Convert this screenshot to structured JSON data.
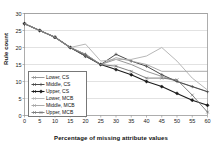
{
  "chart_data": {
    "type": "line",
    "title": "",
    "xlabel": "Percentage of missing attribute values",
    "ylabel": "Rule count",
    "xlim": [
      0,
      60
    ],
    "ylim": [
      0,
      30
    ],
    "xticks": [
      0,
      5,
      10,
      15,
      20,
      25,
      30,
      35,
      40,
      45,
      50,
      55,
      60
    ],
    "yticks": [
      0,
      5,
      10,
      15,
      20,
      25,
      30
    ],
    "grid": "horizontal",
    "legend_position": "inside-lower-left",
    "x": [
      0,
      5,
      10,
      15,
      20,
      25,
      30,
      35,
      40,
      45,
      50,
      55,
      60
    ],
    "series": [
      {
        "name": "Lower, CS",
        "color": "#8c8c8c",
        "marker": "none",
        "width": 0.9,
        "values": [
          27,
          25,
          23,
          20,
          17.5,
          15,
          16.5,
          15,
          13,
          11.5,
          10,
          8.5,
          7
        ]
      },
      {
        "name": "Middle, CS",
        "color": "#4a4a4a",
        "marker": "plus",
        "width": 1.0,
        "values": [
          27,
          25,
          23,
          20,
          18,
          15,
          18,
          16,
          14.5,
          12,
          10,
          8.5,
          7
        ]
      },
      {
        "name": "Upper, CS",
        "color": "#1a1a1a",
        "marker": "diamond",
        "width": 1.1,
        "values": [
          27,
          25,
          23,
          20,
          17.5,
          15,
          13.5,
          12,
          10,
          8.5,
          6.5,
          4.5,
          3
        ]
      },
      {
        "name": "Lower, MCB",
        "color": "#b8b8b8",
        "marker": "none",
        "width": 1.0,
        "values": [
          27,
          25,
          23,
          20,
          21,
          16,
          16.5,
          16.5,
          17.5,
          20,
          16,
          11,
          7.5
        ]
      },
      {
        "name": "Middle, MCB",
        "color": "#a0a0a0",
        "marker": "none",
        "width": 0.9,
        "values": [
          27,
          25,
          23,
          20,
          18,
          15,
          17,
          16,
          15,
          13,
          13,
          13,
          13
        ]
      },
      {
        "name": "Upper, MCB",
        "color": "#757575",
        "marker": "cross",
        "width": 0.9,
        "values": [
          27,
          25,
          23,
          20,
          17.5,
          15,
          14.5,
          13,
          11,
          11,
          10.5,
          6,
          1
        ]
      }
    ]
  }
}
